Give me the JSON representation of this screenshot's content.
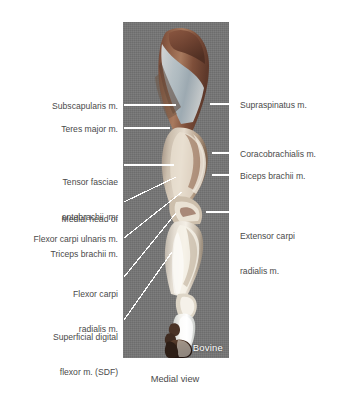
{
  "figure": {
    "caption": "Medial view",
    "specimen_tag": "Bovine",
    "background_color": "#ffffff",
    "plate_background_color": "#757575",
    "label_color": "#4a4a4a",
    "leader_color": "#ffffff"
  },
  "labels_left": [
    {
      "id": "subscapularis",
      "text": "Subscapularis m."
    },
    {
      "id": "teres-major",
      "text": "Teres major m."
    },
    {
      "id": "tensor-fasciae",
      "line1": "Tensor fasciae",
      "line2": "antebrachii  m."
    },
    {
      "id": "medial-head-triceps",
      "line1": "Medial head of",
      "line2": "Triceps brachii m."
    },
    {
      "id": "flexor-carpi-ulnaris",
      "text": "Flexor carpi ulnaris m."
    },
    {
      "id": "flexor-carpi-radialis",
      "line1": "Flexor carpi",
      "line2": "radialis m."
    },
    {
      "id": "superficial-digital-flexor",
      "line1": "Superficial digital",
      "line2": "flexor m. (SDF)"
    }
  ],
  "labels_right": [
    {
      "id": "supraspinatus",
      "text": "Supraspinatus m."
    },
    {
      "id": "coracobrachialis",
      "text": "Coracobrachialis m."
    },
    {
      "id": "biceps-brachii",
      "text": "Biceps brachii m."
    },
    {
      "id": "extensor-carpi-radialis",
      "line1": "Extensor carpi",
      "line2": "radialis m."
    }
  ]
}
